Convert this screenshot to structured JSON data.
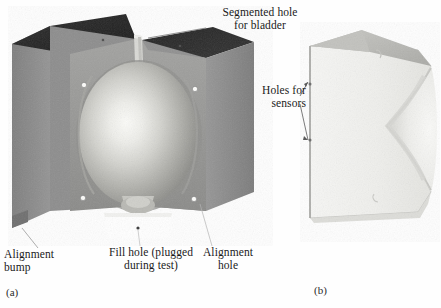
{
  "figure": {
    "kind": "two-panel technical photograph",
    "panels": [
      {
        "tag": "(a)",
        "caption_role": "assembled segmented mold with spherical bladder cavity"
      },
      {
        "tag": "(b)",
        "caption_role": "sectioned half of mold showing hemispherical cavity"
      }
    ]
  },
  "panel_a": {
    "tag": "(a)",
    "labels": {
      "segmented_hole": "Segmented hole\nfor bladder",
      "alignment_bump": "Alignment\nbump",
      "fill_hole": "Fill hole (plugged\nduring test)",
      "alignment_hole": "Alignment\nhole"
    }
  },
  "panel_b": {
    "tag": "(b)",
    "labels": {
      "holes_for_sensors": "Holes for\nsensors"
    }
  },
  "colors": {
    "background": "#fefefe",
    "top_face_dark": "#262626",
    "top_face_dark_2": "#1f1f1f",
    "side_face_gray": "#8d8d8d",
    "side_face_gray_dark": "#7a7a7a",
    "front_face_gray": "#8a8a8a",
    "inner_wall_gray": "#9a9a9a",
    "sphere_highlight": "#f4f4f0",
    "sphere_mid": "#c9c9c4",
    "sphere_edge": "#8f8f8c",
    "sensor_hole_white": "#fdfdfd",
    "notch_white": "#ffffff",
    "slot_light": "#d8d8d4",
    "section_body_light": "#f1f1ef",
    "section_body_shade": "#e2e2df",
    "section_top_gray": "#b6b6b2",
    "section_cavity": "#e9e9e6",
    "section_edge": "#9d9d99",
    "text": "#1a1a1a",
    "leader_line": "#555555"
  }
}
